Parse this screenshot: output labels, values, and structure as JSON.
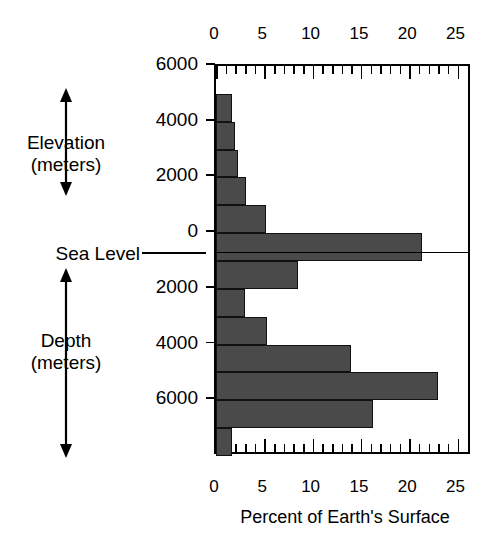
{
  "chart_data": {
    "type": "bar",
    "orientation": "horizontal",
    "title": "",
    "xlabel": "Percent of Earth's Surface",
    "ylabel": "Elevation / Depth (meters)",
    "xlim": [
      0,
      26.5
    ],
    "ylim": [
      -8000,
      6000
    ],
    "xticks": [
      0,
      5,
      10,
      15,
      20,
      25
    ],
    "xticklabels": [
      "0",
      "5",
      "10",
      "15",
      "20",
      "25"
    ],
    "x_minor_tick_step": 1,
    "yticks": [
      6000,
      4000,
      2000,
      0,
      -2000,
      -4000,
      -6000
    ],
    "yticklabels": [
      "6000",
      "4000",
      "2000",
      "0",
      "2000",
      "4000",
      "6000"
    ],
    "grid": false,
    "legend": false,
    "bar_color": "#4a4a4a",
    "bar_edge_color": "#111111",
    "band_height_meters": 1000,
    "categories": [
      "5000 to 6000",
      "4000 to 5000",
      "3000 to 4000",
      "2000 to 3000",
      "1000 to 2000",
      "0 to 1000",
      "0 to -1000",
      "-1000 to -2000",
      "-2000 to -3000",
      "-3000 to -4000",
      "-4000 to -5000",
      "-5000 to -6000",
      "-6000 to -7000",
      "-7000 to -8000"
    ],
    "bands": [
      {
        "top": 6000,
        "bottom": 5000,
        "value": 0.0
      },
      {
        "top": 5000,
        "bottom": 4000,
        "value": 1.7
      },
      {
        "top": 4000,
        "bottom": 3000,
        "value": 2.0
      },
      {
        "top": 3000,
        "bottom": 2000,
        "value": 2.3
      },
      {
        "top": 2000,
        "bottom": 1000,
        "value": 3.1
      },
      {
        "top": 1000,
        "bottom": 0,
        "value": 5.2
      },
      {
        "top": 0,
        "bottom": -1000,
        "value": 21.3
      },
      {
        "top": -1000,
        "bottom": -2000,
        "value": 8.5
      },
      {
        "top": -2000,
        "bottom": -3000,
        "value": 3.0
      },
      {
        "top": -3000,
        "bottom": -4000,
        "value": 5.3
      },
      {
        "top": -4000,
        "bottom": -5000,
        "value": 14.0
      },
      {
        "top": -5000,
        "bottom": -6000,
        "value": 23.0
      },
      {
        "top": -6000,
        "bottom": -7000,
        "value": 16.3
      },
      {
        "top": -7000,
        "bottom": -8000,
        "value": 1.7
      }
    ],
    "values": [
      0.0,
      1.7,
      2.0,
      2.3,
      3.1,
      5.2,
      21.3,
      8.5,
      3.0,
      5.3,
      14.0,
      23.0,
      16.3,
      1.7
    ]
  },
  "annotations": {
    "elevation_label_line1": "Elevation",
    "elevation_label_line2": "(meters)",
    "sea_level_label": "Sea Level",
    "depth_label_line1": "Depth",
    "depth_label_line2": "(meters)"
  },
  "axis": {
    "x_title": "Percent of Earth's Surface"
  }
}
